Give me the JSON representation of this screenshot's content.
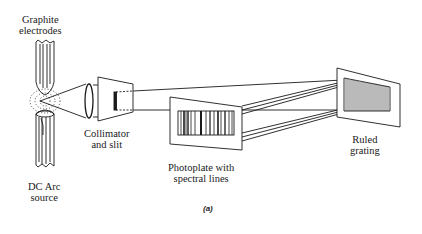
{
  "diagram": {
    "caption": "(a)",
    "labels": {
      "electrodes_line1": "Graphite",
      "electrodes_line2": "electrodes",
      "source_line1": "DC Arc",
      "source_line2": "source",
      "collimator_line1": "Collimator",
      "collimator_line2": "and slit",
      "photoplate_line1": "Photoplate with",
      "photoplate_line2": "spectral lines",
      "grating_line1": "Ruled",
      "grating_line2": "grating"
    },
    "components": [
      "graphite-electrodes",
      "dc-arc-source",
      "collimator-lens",
      "slit",
      "photoplate",
      "ruled-grating"
    ],
    "colors": {
      "ink": "#1a1a1a",
      "background": "#ffffff"
    }
  }
}
